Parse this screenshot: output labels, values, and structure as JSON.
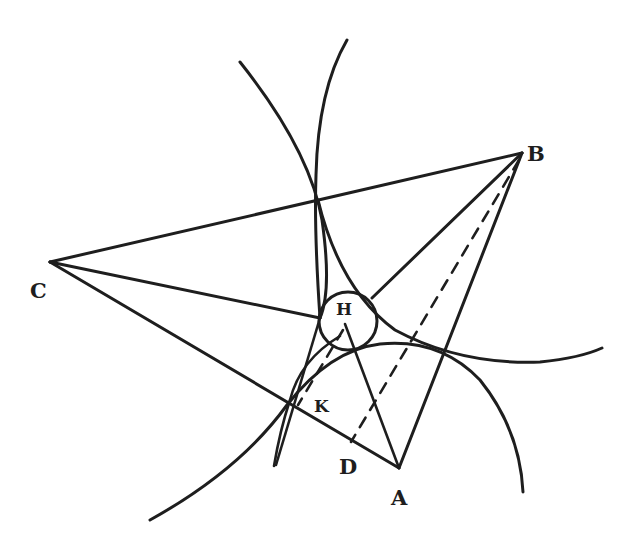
{
  "diagram": {
    "type": "geometric construction",
    "points": {
      "A": {
        "label": "A",
        "x": 399,
        "y": 468
      },
      "B": {
        "label": "B",
        "x": 522,
        "y": 153
      },
      "C": {
        "label": "C",
        "x": 50,
        "y": 262
      },
      "D": {
        "label": "D",
        "x": 351,
        "y": 442
      },
      "H": {
        "label": "H",
        "x": 348,
        "y": 321
      },
      "K": {
        "label": "K",
        "x": 287,
        "y": 407
      }
    },
    "segments": [
      "CB",
      "CA",
      "BA",
      "C-circle",
      "B-circle",
      "A-H",
      "B-D (dashed)",
      "K-H (dashed)"
    ],
    "circle_center_label": "H",
    "stroke_color": "#1e1e1e",
    "background_color": "#ffffff"
  }
}
